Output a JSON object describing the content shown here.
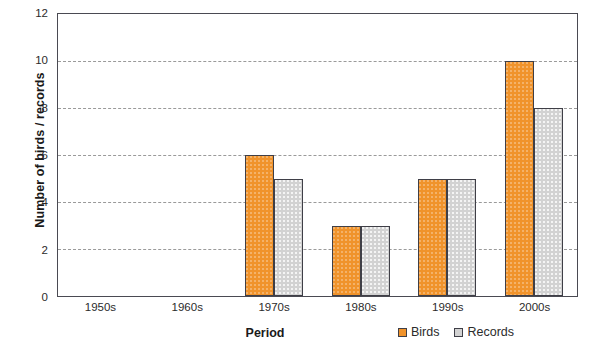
{
  "chart_data": {
    "type": "bar",
    "title": "",
    "xlabel": "Period",
    "ylabel": "Number of birds / records",
    "categories": [
      "1950s",
      "1960s",
      "1970s",
      "1980s",
      "1990s",
      "2000s"
    ],
    "series": [
      {
        "name": "Birds",
        "color": "#f0932b",
        "values": [
          0,
          0,
          6,
          3,
          5,
          10
        ]
      },
      {
        "name": "Records",
        "color": "#d2d2d2",
        "values": [
          0,
          0,
          5,
          3,
          5,
          8
        ]
      }
    ],
    "ylim": [
      0,
      12
    ],
    "yticks": [
      0,
      2,
      4,
      6,
      8,
      10,
      12
    ],
    "ytick_labels": [
      "0",
      "2",
      "4",
      "6",
      "8",
      "10",
      "12"
    ],
    "grid": "horizontal-dashed",
    "legend_position": "bottom-right"
  },
  "legend": {
    "items": [
      {
        "label": "Birds"
      },
      {
        "label": "Records"
      }
    ]
  }
}
